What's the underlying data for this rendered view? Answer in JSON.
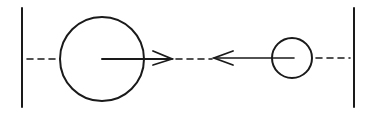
{
  "diagram": {
    "colors": {
      "stroke": "#1a1a1a",
      "background": "#ffffff"
    },
    "walls": [
      {
        "id": "left-wall",
        "x": 22,
        "y1": 8,
        "y2": 107
      },
      {
        "id": "right-wall",
        "x": 354,
        "y1": 8,
        "y2": 107
      }
    ],
    "circles": [
      {
        "id": "large-sphere",
        "cx": 102,
        "cy": 59,
        "r": 42
      },
      {
        "id": "small-sphere",
        "cx": 292,
        "cy": 58,
        "r": 20
      }
    ],
    "arrows": [
      {
        "id": "large-sphere-velocity",
        "direction": "right",
        "x1": 102,
        "x2": 172,
        "y": 59
      },
      {
        "id": "small-sphere-velocity",
        "direction": "left",
        "x1": 294,
        "x2": 214,
        "y": 58
      }
    ],
    "dashed_segments": [
      {
        "id": "left-dash",
        "x1": 26,
        "x2": 60,
        "y": 59
      },
      {
        "id": "center-dash",
        "x1": 172,
        "x2": 214,
        "y": 59
      },
      {
        "id": "right-dash",
        "x1": 313,
        "x2": 350,
        "y": 58
      }
    ]
  }
}
